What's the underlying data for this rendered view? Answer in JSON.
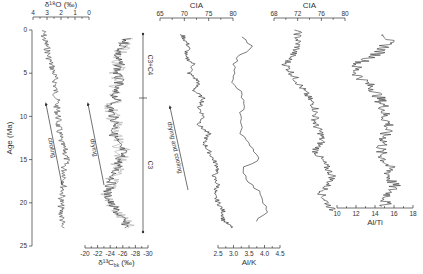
{
  "figure": {
    "yaxis": {
      "label": "Age (Ma)",
      "ticks": [
        "0",
        "5",
        "10",
        "15",
        "20",
        "25"
      ]
    },
    "panels": [
      {
        "id": "d18o",
        "title": "δ¹⁸O (‰)",
        "axis_position": "top",
        "ticks": [
          "4",
          "3",
          "2",
          "1",
          "0"
        ]
      },
      {
        "id": "d13c",
        "title": "δ¹³C",
        "title_sub": "bk",
        "title_suffix": " (‰)",
        "axis_position": "bottom",
        "ticks": [
          "-20",
          "-22",
          "-24",
          "-26",
          "-28",
          "-30"
        ]
      },
      {
        "id": "cia1",
        "title": "CIA",
        "axis_position": "top",
        "ticks": [
          "65",
          "70",
          "75",
          "80"
        ]
      },
      {
        "id": "alk",
        "title": "Al/K",
        "axis_position": "bottom",
        "ticks": [
          "2.5",
          "3.0",
          "3.5",
          "4.0",
          "4.5"
        ]
      },
      {
        "id": "cia2",
        "title": "CIA",
        "axis_position": "top",
        "ticks": [
          "68",
          "72",
          "76",
          "80"
        ]
      },
      {
        "id": "alti",
        "title": "Al/Ti",
        "axis_position": "bottom",
        "ticks": [
          "10",
          "12",
          "14",
          "16",
          "18"
        ]
      }
    ],
    "annotations": {
      "cooling": "cooling",
      "drying": "drying",
      "drying_cooling": "drying and cooling",
      "c3c4": "C3+C4",
      "c3": "C3"
    }
  },
  "chart_data": {
    "type": "line",
    "title": "",
    "ylabel": "Age (Ma)",
    "ylim": [
      0,
      25
    ],
    "y_inverted": true,
    "series": [
      {
        "name": "δ18O (‰)",
        "xlim": [
          4,
          0
        ],
        "age": [
          0,
          1,
          2,
          3,
          4,
          5,
          6,
          7,
          8,
          9,
          10,
          11,
          12,
          13,
          14,
          15,
          16,
          17,
          18,
          19,
          20,
          21,
          22,
          23
        ],
        "values": [
          3.3,
          3.2,
          3.0,
          2.9,
          2.7,
          2.5,
          2.4,
          2.4,
          2.3,
          2.3,
          2.2,
          2.2,
          2.1,
          2.0,
          1.7,
          1.6,
          1.8,
          1.7,
          1.8,
          1.9,
          2.0,
          2.0,
          1.9,
          2.0
        ]
      },
      {
        "name": "δ13C bk (‰)",
        "xlim": [
          -20,
          -30
        ],
        "age": [
          0,
          1,
          2,
          3,
          4,
          5,
          6,
          7,
          8,
          9,
          10,
          11,
          12,
          13,
          14,
          15,
          16,
          17,
          18,
          19,
          20,
          21,
          22,
          23
        ],
        "values": [
          -26,
          -26.5,
          -26,
          -25,
          -25.5,
          -25,
          -25.5,
          -24.5,
          -25,
          -24,
          -24.5,
          -25,
          -24.5,
          -25,
          -26,
          -25.5,
          -25,
          -24.5,
          -24,
          -23.5,
          -24,
          -25,
          -26,
          -27
        ]
      },
      {
        "name": "CIA",
        "xlim": [
          65,
          80
        ],
        "age": [
          0,
          1,
          2,
          3,
          4,
          5,
          6,
          7,
          8,
          9,
          10,
          11,
          12,
          13,
          14,
          15,
          16,
          17,
          18,
          19,
          20,
          21,
          22,
          23
        ],
        "values": [
          69,
          70,
          71,
          70,
          72,
          71,
          73,
          72,
          74,
          73,
          74,
          73,
          75,
          74,
          75,
          76,
          77,
          76,
          77,
          76,
          77,
          78,
          78,
          80
        ]
      },
      {
        "name": "Al/K",
        "xlim": [
          2.5,
          4.5
        ],
        "age": [
          0,
          1,
          2,
          3,
          4,
          5,
          6,
          7,
          8,
          9,
          10,
          11,
          12,
          13,
          14,
          15,
          16,
          17,
          18,
          19,
          20,
          21,
          22,
          23
        ],
        "values": [
          3.1,
          3.3,
          3.6,
          3.2,
          3.0,
          3.1,
          2.9,
          3.2,
          3.3,
          3.3,
          3.2,
          3.3,
          3.2,
          3.5,
          3.7,
          3.8,
          3.3,
          3.4,
          3.6,
          3.9,
          4.0,
          4.1,
          3.7,
          3.6
        ]
      },
      {
        "name": "CIA (2)",
        "xlim": [
          68,
          80
        ],
        "age": [
          0,
          1,
          2,
          3,
          4,
          5,
          6,
          7,
          8,
          9,
          10,
          11,
          12,
          13,
          14,
          15,
          16,
          17,
          18,
          19,
          20,
          21,
          22,
          23
        ],
        "values": [
          72,
          72,
          72,
          71,
          70,
          71,
          72,
          73,
          74,
          75,
          75,
          75,
          76,
          76,
          75,
          76,
          77,
          78,
          77,
          76,
          77,
          78,
          78,
          78
        ]
      },
      {
        "name": "Al/Ti",
        "xlim": [
          10,
          18
        ],
        "age": [
          0,
          1,
          2,
          3,
          4,
          5,
          6,
          7,
          8,
          9,
          10,
          11,
          12,
          13,
          14,
          15,
          16,
          17,
          18,
          19,
          20,
          21,
          22,
          23
        ],
        "values": [
          15,
          15.5,
          15,
          14,
          12,
          12,
          13,
          14,
          14.5,
          15,
          15,
          15.5,
          15,
          15,
          14.5,
          15,
          15.5,
          15.5,
          16,
          15.5,
          15,
          15.5,
          15.5,
          16
        ]
      }
    ],
    "annotations": [
      "cooling (arrow up-left)",
      "drying (arrow up-left)",
      "drying and cooling (arrow up-left)",
      "C3+C4 (0–8 Ma)",
      "C3 (8–23 Ma)"
    ]
  }
}
